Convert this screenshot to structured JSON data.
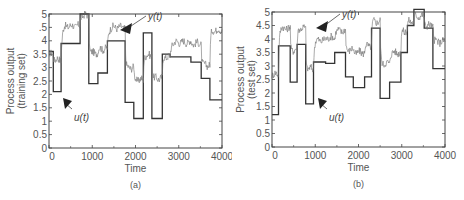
{
  "chart_data": [
    {
      "type": "line",
      "panel": "a",
      "caption": "(a)",
      "title": "",
      "xlabel": "Time",
      "ylabel": "Process output (training set)",
      "ylabel_lines": [
        "Process output",
        "(training set)"
      ],
      "xlim": [
        0,
        4000
      ],
      "ylim": [
        0,
        5
      ],
      "xticks": [
        0,
        1000,
        2000,
        3000,
        4000
      ],
      "xtick_labels": [
        "0",
        "1000",
        "2000",
        "3000",
        "4000"
      ],
      "yticks": [
        0,
        0.5,
        1,
        1.5,
        2,
        2.5,
        3,
        3.5,
        4,
        4.5,
        5
      ],
      "ytick_labels": [
        "0",
        "0.5",
        "1",
        "1.5",
        "2",
        "2.5",
        "3",
        "3.5",
        "4",
        ".5",
        "5"
      ],
      "grid": false,
      "series": [
        {
          "name": "u(t)",
          "style": "step",
          "color": "#333333",
          "x": [
            0,
            100,
            280,
            720,
            920,
            1130,
            1350,
            1760,
            1960,
            2180,
            2380,
            2620,
            2800,
            3280,
            3520,
            3720,
            4000
          ],
          "values": [
            3.6,
            2.1,
            3.9,
            5.0,
            2.4,
            2.8,
            4.0,
            1.7,
            1.1,
            4.3,
            1.1,
            3.5,
            3.4,
            3.2,
            2.6,
            1.8,
            3.7
          ]
        },
        {
          "name": "y(t)",
          "style": "noisy-step",
          "color": "#777777",
          "x": [
            0,
            100,
            280,
            720,
            920,
            1130,
            1350,
            1760,
            1960,
            2180,
            2380,
            2620,
            2800,
            3280,
            3520,
            3720,
            4000
          ],
          "values": [
            3.5,
            3.3,
            4.55,
            4.95,
            3.55,
            3.7,
            4.5,
            3.0,
            2.55,
            3.45,
            2.6,
            3.4,
            3.95,
            3.9,
            3.1,
            4.4,
            4.4
          ]
        }
      ],
      "annotations": [
        {
          "text": "y(t)",
          "x": 1850,
          "y": 4.6
        },
        {
          "text": "u(t)",
          "x": 350,
          "y": 1.3
        }
      ]
    },
    {
      "type": "line",
      "panel": "b",
      "caption": "(b)",
      "title": "",
      "xlabel": "Time",
      "ylabel": "Process output (test set)",
      "ylabel_lines": [
        "Process output",
        "(test set)"
      ],
      "xlim": [
        0,
        4000
      ],
      "ylim": [
        0,
        5
      ],
      "xticks": [
        0,
        1000,
        2000,
        3000,
        4000
      ],
      "xtick_labels": [
        "0",
        "1000",
        "2000",
        "3000",
        "4000"
      ],
      "yticks": [
        0,
        0.5,
        1,
        1.5,
        2,
        2.5,
        3,
        3.5,
        4,
        4.5,
        5
      ],
      "ytick_labels": [
        "0",
        "0.5",
        "1",
        "1.5",
        "2",
        "2.5",
        "3",
        "3.5",
        "4",
        "4.5",
        "5"
      ],
      "grid": false,
      "series": [
        {
          "name": "u(t)",
          "style": "step",
          "color": "#333333",
          "x": [
            0,
            150,
            420,
            580,
            780,
            960,
            1240,
            1450,
            1700,
            1880,
            2140,
            2300,
            2500,
            2720,
            2980,
            3130,
            3280,
            3520,
            3720,
            4000
          ],
          "values": [
            1.2,
            3.75,
            2.4,
            3.8,
            1.6,
            3.15,
            3.1,
            3.5,
            2.6,
            2.2,
            2.6,
            4.4,
            1.8,
            2.4,
            3.5,
            4.5,
            5.1,
            4.4,
            2.9,
            3.25
          ]
        },
        {
          "name": "y(t)",
          "style": "noisy-step",
          "color": "#777777",
          "x": [
            0,
            150,
            420,
            580,
            780,
            960,
            1240,
            1450,
            1700,
            1880,
            2140,
            2300,
            2500,
            2720,
            2980,
            3130,
            3280,
            3520,
            3720,
            4000
          ],
          "values": [
            2.7,
            4.4,
            3.6,
            4.4,
            2.9,
            3.95,
            4.05,
            4.3,
            3.6,
            3.5,
            3.75,
            4.65,
            3.1,
            3.5,
            4.3,
            4.65,
            4.85,
            4.5,
            3.9,
            4.1
          ]
        }
      ],
      "annotations": [
        {
          "text": "y(t)",
          "x": 1550,
          "y": 4.7
        },
        {
          "text": "u(t)",
          "x": 1380,
          "y": 1.1
        }
      ]
    }
  ]
}
